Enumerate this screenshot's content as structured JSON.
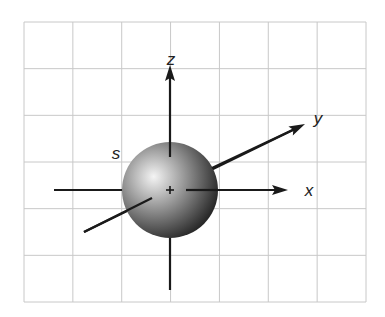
{
  "diagram": {
    "grid": {
      "left": 24,
      "top": 22,
      "right": 366,
      "bottom": 302,
      "columns": 7,
      "rows": 6,
      "color": "#c8c8c8"
    },
    "sphere": {
      "label": "s",
      "cx": 170,
      "cy": 190,
      "r": 48,
      "highlight_color": "#f2f2f2",
      "shadow_color": "#1a1a1a"
    },
    "axes": {
      "x": {
        "label": "x",
        "from": [
          54,
          190
        ],
        "to": [
          288,
          190
        ]
      },
      "y": {
        "label": "y",
        "from": [
          84,
          232
        ],
        "to": [
          305,
          124
        ]
      },
      "z": {
        "label": "z",
        "from": [
          170,
          290
        ],
        "to": [
          170,
          65
        ]
      }
    },
    "origin_marker": "+",
    "labels": {
      "x": "x",
      "y": "y",
      "z": "z",
      "s": "s"
    },
    "colors": {
      "axis": "#1a1a1a",
      "label": "#222222"
    }
  }
}
